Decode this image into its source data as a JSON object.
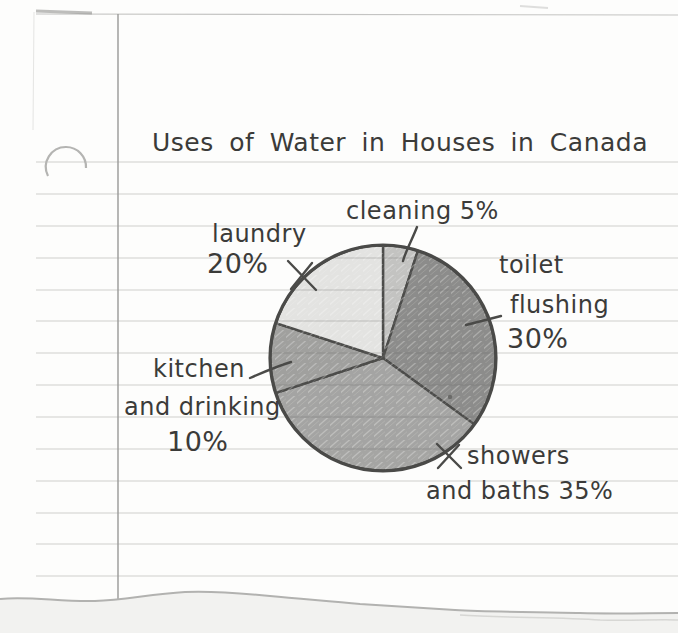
{
  "page": {
    "title": "Uses of Water in Houses in Canada",
    "paper_line_color": "#cfcfcc",
    "ink_color": "#4a4a48"
  },
  "chart_data": {
    "type": "pie",
    "title": "Uses of Water in Houses in Canada",
    "unit": "%",
    "direction": "clockwise",
    "start_angle_deg_from_12": 0,
    "legend": "none",
    "slices": [
      {
        "label": "cleaning",
        "value": 5,
        "color": "#c3c3c1",
        "label_lines": [
          "cleaning 5%"
        ]
      },
      {
        "label": "toilet flushing",
        "value": 30,
        "color": "#8d8d8b",
        "label_lines": [
          "toilet",
          "flushing",
          "30%"
        ]
      },
      {
        "label": "showers and baths",
        "value": 35,
        "color": "#a5a5a3",
        "label_lines": [
          "showers",
          "and baths 35%"
        ]
      },
      {
        "label": "kitchen and drinking",
        "value": 10,
        "color": "#a0a09e",
        "label_lines": [
          "kitchen",
          "and drinking",
          "10%"
        ]
      },
      {
        "label": "laundry",
        "value": 20,
        "color": "#e3e3e1",
        "label_lines": [
          "laundry",
          "20%"
        ]
      }
    ]
  }
}
